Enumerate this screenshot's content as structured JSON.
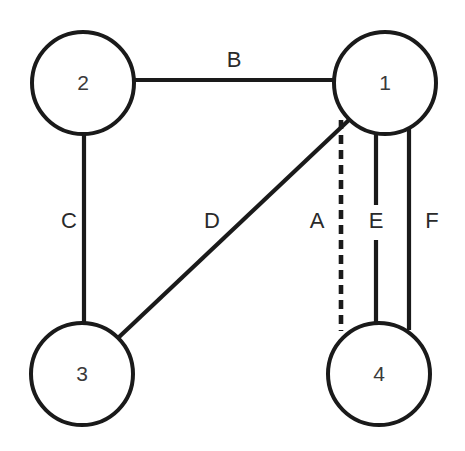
{
  "diagram": {
    "canvas": {
      "width": 465,
      "height": 451,
      "background": "#ffffff"
    },
    "stroke_color": "#1a1a1a",
    "node_fill": "#ffffff",
    "label_color": "#2a2a2a"
  },
  "nodes": [
    {
      "id": "1",
      "label": "1",
      "cx": 385,
      "cy": 83,
      "r": 51
    },
    {
      "id": "2",
      "label": "2",
      "cx": 83,
      "cy": 83,
      "r": 51
    },
    {
      "id": "3",
      "label": "3",
      "cx": 82,
      "cy": 374,
      "r": 51
    },
    {
      "id": "4",
      "label": "4",
      "cx": 379,
      "cy": 374,
      "r": 51
    }
  ],
  "edges": [
    {
      "id": "A",
      "label": "A",
      "from": "1",
      "to": "4",
      "style": "dashed",
      "x1": 341,
      "y1": 120,
      "x2": 341,
      "y2": 331,
      "label_x": 317,
      "label_y": 222
    },
    {
      "id": "B",
      "label": "B",
      "from": "2",
      "to": "1",
      "style": "solid",
      "x1": 134,
      "y1": 80,
      "x2": 334,
      "y2": 80,
      "label_x": 234,
      "label_y": 61
    },
    {
      "id": "C",
      "label": "C",
      "from": "2",
      "to": "3",
      "style": "solid",
      "x1": 84,
      "y1": 134,
      "x2": 84,
      "y2": 324,
      "label_x": 69,
      "label_y": 222
    },
    {
      "id": "D",
      "label": "D",
      "from": "3",
      "to": "1",
      "style": "solid",
      "x1": 118,
      "y1": 338,
      "x2": 350,
      "y2": 119,
      "label_x": 212,
      "label_y": 222
    },
    {
      "id": "E",
      "label": "E",
      "from": "1",
      "to": "4",
      "style": "solid-gapped",
      "x1": 376,
      "y1": 132,
      "x2": 376,
      "y2": 325,
      "gap_top": 205,
      "gap_bottom": 240,
      "label_x": 376,
      "label_y": 222
    },
    {
      "id": "F",
      "label": "F",
      "from": "1",
      "to": "4",
      "style": "solid",
      "x1": 409,
      "y1": 128,
      "x2": 409,
      "y2": 330,
      "label_x": 432,
      "label_y": 222
    }
  ]
}
